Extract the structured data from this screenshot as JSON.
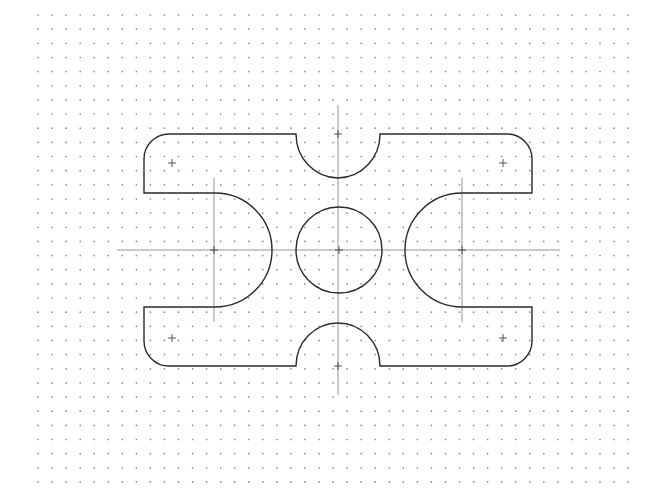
{
  "drawing": {
    "type": "2D CAD part outline on dot grid",
    "background": "#ffffff",
    "line_color": "#2a2a2a",
    "grid": {
      "x0": 38,
      "y0": 15,
      "dx": 14.05,
      "dy": 14.15,
      "cols": 43,
      "rows": 34,
      "dot_color": "#8a8a8a"
    },
    "part_outline": {
      "left": 144,
      "right": 532,
      "top": 134,
      "bottom": 366,
      "corner_radius": 25,
      "top_notch": {
        "cx": 338,
        "x1": 296,
        "x2": 380,
        "depth": 44
      },
      "bottom_notch": {
        "cx": 338,
        "x1": 296,
        "x2": 380,
        "depth": 43
      },
      "left_slot": {
        "cx": 215,
        "cy": 250,
        "r": 57
      },
      "right_slot": {
        "cx": 462,
        "cy": 250,
        "r": 57
      }
    },
    "center_hole": {
      "cx": 339,
      "cy": 250,
      "r": 43
    },
    "centerlines": {
      "horizontal": {
        "y": 250,
        "x1": 117,
        "x2": 560
      },
      "vertical": {
        "x": 338,
        "y1": 105,
        "y2": 395
      },
      "left_slot_axis": {
        "x": 214,
        "y1": 178,
        "y2": 322
      },
      "right_slot_axis": {
        "x": 462,
        "y1": 178,
        "y2": 322
      }
    },
    "markers": [
      {
        "name": "top-left",
        "x": 172,
        "y": 163
      },
      {
        "name": "top-right",
        "x": 503,
        "y": 163
      },
      {
        "name": "bottom-left",
        "x": 172,
        "y": 338
      },
      {
        "name": "bottom-right",
        "x": 503,
        "y": 338
      },
      {
        "name": "top-notch-center",
        "x": 338,
        "y": 134
      },
      {
        "name": "bottom-notch-center",
        "x": 338,
        "y": 366
      },
      {
        "name": "hole-center",
        "x": 339,
        "y": 250
      },
      {
        "name": "left-slot-center",
        "x": 214,
        "y": 250
      },
      {
        "name": "right-slot-center",
        "x": 462,
        "y": 250
      }
    ]
  }
}
